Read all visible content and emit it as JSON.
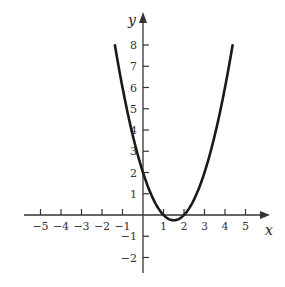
{
  "chart_data": {
    "type": "line",
    "title": "",
    "function": "y = x^2 - 3x + 2",
    "xlabel": "x",
    "ylabel": "y",
    "x_ticks": [
      -5,
      -4,
      -3,
      -2,
      -1,
      1,
      2,
      3,
      4,
      5
    ],
    "y_ticks": [
      -2,
      -1,
      1,
      2,
      3,
      4,
      5,
      6,
      7,
      8
    ],
    "x_tick_labels": [
      "−5",
      "−4",
      "−3",
      "−2",
      "−1",
      "1",
      "2",
      "3",
      "4",
      "5"
    ],
    "y_tick_labels": [
      "−2",
      "−1",
      "1",
      "2",
      "3",
      "4",
      "5",
      "6",
      "7",
      "8"
    ],
    "xlim": [
      -5.5,
      6
    ],
    "ylim": [
      -2.7,
      9.5
    ],
    "grid": false,
    "legend": null,
    "series": [
      {
        "name": "parabola",
        "x": [
          -1.37,
          -1,
          0,
          1,
          1.5,
          2,
          3,
          4,
          4.37
        ],
        "y": [
          8,
          6,
          2,
          0,
          -0.25,
          0,
          2,
          6,
          8
        ]
      }
    ],
    "key_points": {
      "y_intercept": [
        0,
        2
      ],
      "roots": [
        1,
        2
      ],
      "vertex": [
        1.5,
        -0.25
      ]
    },
    "colors": {
      "curve": "#1a1a1a",
      "axes": "#333333"
    }
  }
}
